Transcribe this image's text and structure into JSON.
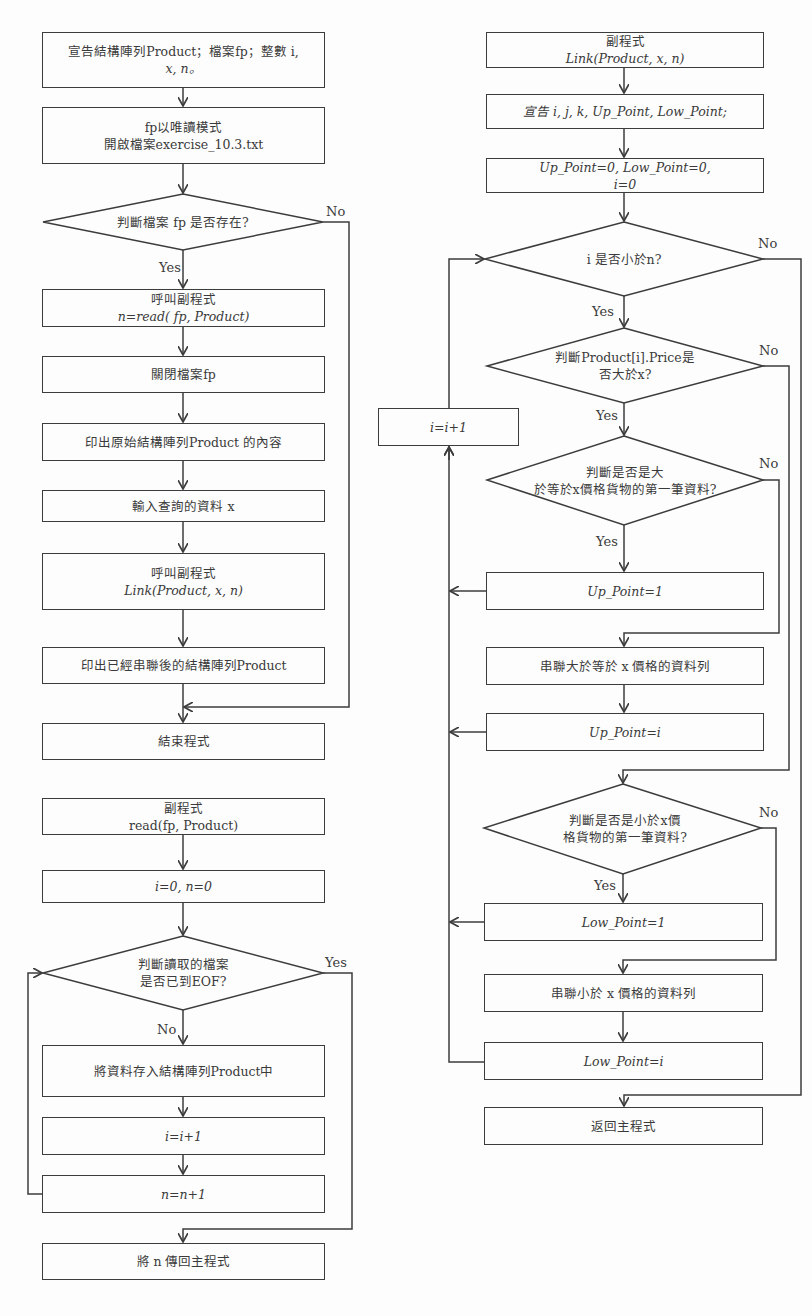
{
  "main_program": {
    "declare": {
      "line1": "宣告結構陣列Product；檔案fp；整數 i,",
      "line2": "x, n。"
    },
    "open_file": {
      "line1": "fp以唯讀模式",
      "line2": "開啟檔案exercise_10.3.txt"
    },
    "check_file": "判斷檔案 fp 是否存在?",
    "check_no": "No",
    "check_yes": "Yes",
    "call_read": {
      "line1": "呼叫副程式",
      "line2": "n=read( fp, Product)"
    },
    "close_file": "關閉檔案fp",
    "print_original": "印出原始結構陣列Product 的內容",
    "input_x": "輸入查詢的資料 x",
    "call_link": {
      "line1": "呼叫副程式",
      "line2": "Link(Product, x, n)"
    },
    "print_linked": "印出已經串聯後的結構陣列Product",
    "end": "結束程式"
  },
  "read_subroutine": {
    "header": {
      "line1": "副程式",
      "line2": "read(fp, Product)"
    },
    "init": "i=0, n=0",
    "check_eof": {
      "line1": "判斷讀取的檔案",
      "line2": "是否已到EOF?"
    },
    "eof_yes": "Yes",
    "eof_no": "No",
    "store": "將資料存入結構陣列Product中",
    "inc_i": "i=i+1",
    "inc_n": "n=n+1",
    "return_n": "將 n 傳回主程式"
  },
  "link_subroutine": {
    "header": {
      "line1": "副程式",
      "line2": "Link(Product, x, n)"
    },
    "declare": "宣告 i, j, k, Up_Point, Low_Point;",
    "init": {
      "line1": "Up_Point=0, Low_Point=0,",
      "line2": "i=0"
    },
    "check_i": "i 是否小於n?",
    "check_i_no": "No",
    "check_i_yes": "Yes",
    "check_price": {
      "line1": "判斷Product[i].Price是",
      "line2": "否大於x?"
    },
    "check_price_no": "No",
    "check_price_yes": "Yes",
    "inc_i": "i=i+1",
    "check_first_up": {
      "line1": "判斷是否是大",
      "line2": "於等於x價格貨物的第一筆資料?"
    },
    "check_first_up_no": "No",
    "check_first_up_yes": "Yes",
    "up_point_1": "Up_Point=1",
    "link_up": "串聯大於等於 x 價格的資料列",
    "up_point_i": "Up_Point=i",
    "check_first_low": {
      "line1": "判斷是否是小於x價",
      "line2": "格貨物的第一筆資料?"
    },
    "check_first_low_no": "No",
    "check_first_low_yes": "Yes",
    "low_point_1": "Low_Point=1",
    "link_low": "串聯小於 x 價格的資料列",
    "low_point_i": "Low_Point=i",
    "return_main": "返回主程式"
  },
  "colors": {
    "line": "#3c3c3c",
    "background": "#fdfdfd",
    "text": "#3a3a3a"
  }
}
